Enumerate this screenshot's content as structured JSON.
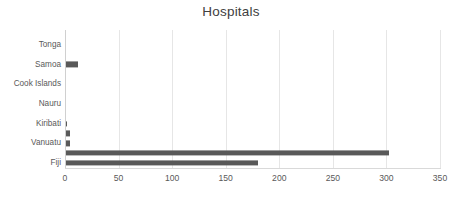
{
  "chart_data": {
    "type": "bar",
    "orientation": "horizontal",
    "title": "Hospitals",
    "xlabel": "",
    "ylabel": "",
    "xlim": [
      0,
      350
    ],
    "xticks": [
      0,
      50,
      100,
      150,
      200,
      250,
      300,
      350
    ],
    "xtick_labels": [
      "0",
      "50",
      "100",
      "150",
      "200",
      "250",
      "300",
      "350"
    ],
    "grid": "vertical",
    "legend": "none",
    "bar_color": "#595959",
    "gridline_color": "#E6E6E6",
    "text_color": "#595959",
    "categories": [
      "",
      "Tonga",
      "",
      "Samoa",
      "",
      "Cook Islands",
      "",
      "Nauru",
      "",
      "Kiribati",
      "",
      "Vanuatu",
      "",
      "Fiji"
    ],
    "values": [
      1,
      1,
      1,
      12,
      0,
      1,
      0,
      1,
      1,
      2,
      5,
      5,
      302,
      180
    ],
    "labeled_points": [
      {
        "category": "Tonga",
        "value": 1
      },
      {
        "category": "Samoa",
        "value": 12
      },
      {
        "category": "Cook Islands",
        "value": 1
      },
      {
        "category": "Nauru",
        "value": 1
      },
      {
        "category": "Kiribati",
        "value": 2
      },
      {
        "category": "Vanuatu",
        "value": 5
      },
      {
        "category": "Fiji",
        "value": 180
      }
    ]
  }
}
